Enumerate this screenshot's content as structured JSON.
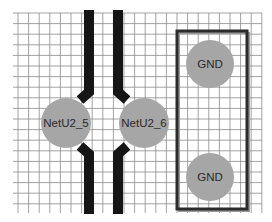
{
  "canvas": {
    "width": 272,
    "height": 222,
    "background": "#ffffff"
  },
  "grid": {
    "color": "#8a8a8a",
    "x_start": 18,
    "x_end": 262,
    "y_start": 13,
    "y_end": 213,
    "spacing": 10.6
  },
  "colors": {
    "trace": "#151515",
    "pad_fill": "#a6a6a6",
    "pad_text": "#2a2a2a",
    "outline": "#2b2b2b",
    "outline_shadow": "#9a9a9a"
  },
  "pads": [
    {
      "id": "netu2-5",
      "label": "NetU2_5",
      "cx": 66,
      "cy": 123,
      "r": 25
    },
    {
      "id": "netu2-6",
      "label": "NetU2_6",
      "cx": 144,
      "cy": 123,
      "r": 25
    },
    {
      "id": "gnd-top",
      "label": "GND",
      "cx": 210,
      "cy": 64,
      "r": 24
    },
    {
      "id": "gnd-bottom",
      "label": "GND",
      "cx": 210,
      "cy": 177,
      "r": 24
    }
  ],
  "component_outline": {
    "x": 177,
    "y": 31,
    "width": 70,
    "height": 178,
    "stroke_width": 3
  },
  "traces": [
    {
      "id": "trace-left",
      "points": "89,10 89,92 80,100",
      "points_bottom": "80,146 89,154 89,214",
      "width": 10
    },
    {
      "id": "trace-right",
      "points": "118,10 118,92 127,100",
      "points_bottom": "127,146 118,154 118,214",
      "width": 10
    }
  ]
}
